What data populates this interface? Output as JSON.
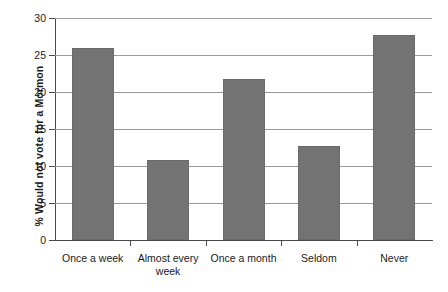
{
  "chart_data": {
    "type": "bar",
    "title": "",
    "xlabel": "",
    "ylabel": "% Would not vote for a Mormon",
    "categories": [
      "Once a week",
      "Almost every week",
      "Once a month",
      "Seldom",
      "Never"
    ],
    "values": [
      26.0,
      10.8,
      21.8,
      12.7,
      27.7
    ],
    "ylim": [
      0,
      30
    ],
    "yticks": [
      0,
      5,
      10,
      15,
      20,
      25,
      30
    ],
    "ytick_labels": [
      "0",
      "5",
      "10",
      "15",
      "20",
      "25",
      "30"
    ],
    "grid": true,
    "legend": null,
    "bar_color": "#737373",
    "axis_color": "#4a4a4a",
    "grid_color": "#9a9a9a",
    "background": "#ffffff"
  }
}
